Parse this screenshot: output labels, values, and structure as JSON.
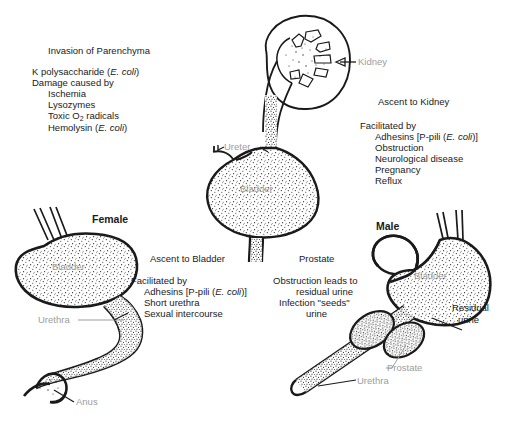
{
  "figure": {
    "background": "#ffffff",
    "ink_color": "#1a1a1a",
    "label_color": "#9d9d9d"
  },
  "text_blocks": {
    "invasion": {
      "heading": "Invasion of Parenchyma",
      "lines": [
        "K polysaccharide (E. coli)",
        "Damage caused by",
        "Ischemia",
        "Lysozymes",
        "Toxic O2 radicals",
        "Hemolysin (E. coli)"
      ]
    },
    "ascent_kidney": {
      "heading": "Ascent to Kidney",
      "lines": [
        "Facilitated by",
        "Adhesins [P-pili (E. coli)]",
        "Obstruction",
        "Neurological disease",
        "Pregnancy",
        "Reflux"
      ]
    },
    "ascent_bladder": {
      "heading": "Ascent to Bladder",
      "lines": [
        "Facilitated by",
        "Adhesins [P-pili (E. coli)]",
        "Short urethra",
        "Sexual intercourse"
      ]
    },
    "prostate_block": {
      "heading": "Prostate",
      "lines": [
        "Obstruction leads to",
        "residual urine",
        "Infection \"seeds\"",
        "urine"
      ]
    }
  },
  "section_titles": {
    "female": "Female",
    "male": "Male"
  },
  "anatomy_labels": {
    "kidney": "Kidney",
    "ureter": "Ureter",
    "bladder_center": "Bladder",
    "bladder_female": "Bladder",
    "bladder_male": "Bladder",
    "urethra_female": "Urethra",
    "anus": "Anus",
    "residual_urine_line1": "Residual",
    "residual_urine_line2": "urine",
    "prostate_label": "Prostate",
    "urethra_male": "Urethra"
  }
}
